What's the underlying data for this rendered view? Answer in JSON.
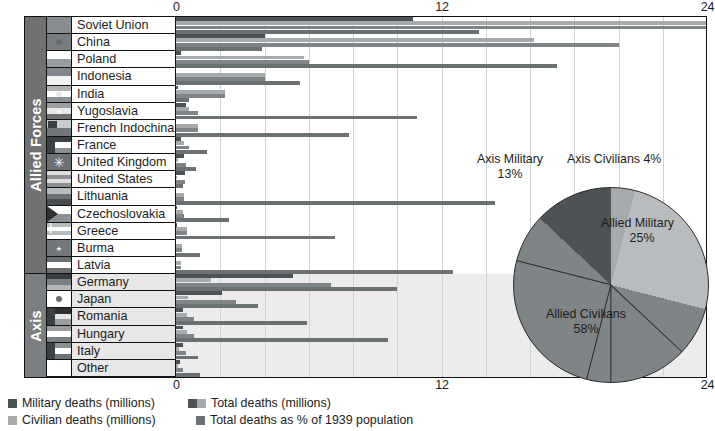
{
  "axis": {
    "ticks": [
      "0",
      "12",
      "24"
    ],
    "tick_values": [
      0,
      12,
      24
    ],
    "max": 24
  },
  "groups": {
    "allied_label": "Allied Forces",
    "axis_label": "Axis"
  },
  "legend": {
    "military": "Military deaths (millions)",
    "civilian": "Civilian deaths (millions)",
    "total": "Total deaths (millions)",
    "percent": "Total deaths  as % of 1939 population"
  },
  "colors": {
    "military": "#4d5255",
    "civilian": "#a7aaac",
    "total": "#7f8486",
    "percent": "#6b7073",
    "band": "#6f7173",
    "axis_row_bg": "#e7e7e7"
  },
  "pie": {
    "title": "",
    "slices": [
      {
        "label": "Allied Civilians",
        "pct_label": "58%",
        "value": 58,
        "color": "#7f8486"
      },
      {
        "label": "Axis Military",
        "pct_label": "13%",
        "value": 13,
        "color": "#4d5255"
      },
      {
        "label": "Axis Civilians 4%",
        "pct_label": "",
        "value": 4,
        "color": "#a7aaac"
      },
      {
        "label": "Allied Military",
        "pct_label": "25%",
        "value": 25,
        "color": "#b9bcbe"
      }
    ]
  },
  "chart_data": {
    "type": "bar",
    "xlabel": "",
    "ylabel": "",
    "xlim": [
      0,
      24
    ],
    "grid": true,
    "legend_position": "bottom-left",
    "orientation": "horizontal",
    "series": [
      {
        "name": "Military deaths (millions)",
        "color": "#4d5255"
      },
      {
        "name": "Civilian deaths (millions)",
        "color": "#a7aaac"
      },
      {
        "name": "Total deaths (millions)",
        "color": "#7f8486"
      },
      {
        "name": "Total deaths  as % of 1939 population",
        "color": "#6b7073"
      }
    ],
    "categories": [
      "Soviet Union",
      "China",
      "Poland",
      "Indonesia",
      "India",
      "Yugoslavia",
      "French Indochina",
      "France",
      "United Kingdom",
      "United States",
      "Lithuania",
      "Czechoslovakia",
      "Greece",
      "Burma",
      "Latvia",
      "Germany",
      "Japan",
      "Romania",
      "Hungary",
      "Italy",
      "Other"
    ],
    "groups": {
      "Allied Forces": [
        "Soviet Union",
        "China",
        "Poland",
        "Indonesia",
        "India",
        "Yugoslavia",
        "French Indochina",
        "France",
        "United Kingdom",
        "United States",
        "Lithuania",
        "Czechoslovakia",
        "Greece",
        "Burma",
        "Latvia"
      ],
      "Axis": [
        "Germany",
        "Japan",
        "Romania",
        "Hungary",
        "Italy",
        "Other"
      ]
    },
    "rows": [
      {
        "country": "Soviet Union",
        "military": 10.7,
        "civilian": 24.0,
        "total": 24.0,
        "pct": 13.7
      },
      {
        "country": "China",
        "military": 4.0,
        "civilian": 16.2,
        "total": 20.0,
        "pct": 3.9
      },
      {
        "country": "Poland",
        "military": 0.24,
        "civilian": 5.8,
        "total": 6.0,
        "pct": 17.2
      },
      {
        "country": "Indonesia",
        "military": 0.0,
        "civilian": 4.0,
        "total": 4.0,
        "pct": 5.6
      },
      {
        "country": "India",
        "military": 0.09,
        "civilian": 2.2,
        "total": 2.2,
        "pct": 0.6
      },
      {
        "country": "Yugoslavia",
        "military": 0.45,
        "civilian": 0.6,
        "total": 1.0,
        "pct": 10.9
      },
      {
        "country": "French Indochina",
        "military": 0.0,
        "civilian": 1.0,
        "total": 1.0,
        "pct": 7.8
      },
      {
        "country": "France",
        "military": 0.21,
        "civilian": 0.35,
        "total": 0.6,
        "pct": 1.4
      },
      {
        "country": "United Kingdom",
        "military": 0.38,
        "civilian": 0.07,
        "total": 0.45,
        "pct": 0.9
      },
      {
        "country": "United States",
        "military": 0.42,
        "civilian": 0.01,
        "total": 0.42,
        "pct": 0.3
      },
      {
        "country": "Lithuania",
        "military": 0.0,
        "civilian": 0.35,
        "total": 0.35,
        "pct": 14.4
      },
      {
        "country": "Czechoslovakia",
        "military": 0.03,
        "civilian": 0.32,
        "total": 0.35,
        "pct": 2.4
      },
      {
        "country": "Greece",
        "military": 0.03,
        "civilian": 0.5,
        "total": 0.5,
        "pct": 7.2
      },
      {
        "country": "Burma",
        "military": 0.0,
        "civilian": 0.25,
        "total": 0.25,
        "pct": 1.1
      },
      {
        "country": "Latvia",
        "military": 0.0,
        "civilian": 0.22,
        "total": 0.22,
        "pct": 12.5
      },
      {
        "country": "Germany",
        "military": 5.3,
        "civilian": 1.6,
        "total": 7.0,
        "pct": 10.0
      },
      {
        "country": "Japan",
        "military": 2.1,
        "civilian": 0.55,
        "total": 2.7,
        "pct": 3.7
      },
      {
        "country": "Romania",
        "military": 0.3,
        "civilian": 0.5,
        "total": 0.8,
        "pct": 5.9
      },
      {
        "country": "Hungary",
        "military": 0.3,
        "civilian": 0.5,
        "total": 0.8,
        "pct": 9.6
      },
      {
        "country": "Italy",
        "military": 0.3,
        "civilian": 0.15,
        "total": 0.46,
        "pct": 1.0
      },
      {
        "country": "Other",
        "military": 0.2,
        "civilian": 0.1,
        "total": 0.3,
        "pct": 1.1
      }
    ]
  },
  "flags": [
    {
      "country": "Soviet Union",
      "bands": [
        "#8a8d8f"
      ],
      "mark": "none"
    },
    {
      "country": "China",
      "bands": [
        "#7a7d7f"
      ],
      "mark": "dot"
    },
    {
      "country": "Poland",
      "bands": [
        "#ffffff",
        "#9a9d9f"
      ],
      "mark": "none"
    },
    {
      "country": "Indonesia",
      "bands": [
        "#83868a",
        "#f2f2f2"
      ],
      "mark": "none"
    },
    {
      "country": "India",
      "bands": [
        "#b0b3b5",
        "#ffffff",
        "#8d9092"
      ],
      "mark": "dot"
    },
    {
      "country": "Yugoslavia",
      "bands": [
        "#9b9ea0",
        "#e8e8e8",
        "#6f7274"
      ],
      "mark": "star"
    },
    {
      "country": "French Indochina",
      "bands": [
        "#c9ccce",
        "#72767a"
      ],
      "mark": "block"
    },
    {
      "country": "France",
      "bands": [
        "#3f4245",
        "#ffffff",
        "#8d9092"
      ],
      "mark": "vert"
    },
    {
      "country": "United Kingdom",
      "bands": [
        "#6d7074"
      ],
      "mark": "union"
    },
    {
      "country": "United States",
      "bands": [
        "#dcdcdc",
        "#8d9092",
        "#dcdcdc",
        "#8d9092"
      ],
      "mark": "none"
    },
    {
      "country": "Lithuania",
      "bands": [
        "#b9bcbe",
        "#6f7274",
        "#4a4d50"
      ],
      "mark": "none"
    },
    {
      "country": "Czechoslovakia",
      "bands": [
        "#ffffff",
        "#8d9092"
      ],
      "mark": "tri"
    },
    {
      "country": "Greece",
      "bands": [
        "#b8bbbd",
        "#ffffff",
        "#b8bbbd",
        "#ffffff"
      ],
      "mark": "cross"
    },
    {
      "country": "Burma",
      "bands": [
        "#72767a"
      ],
      "mark": "star"
    },
    {
      "country": "Latvia",
      "bands": [
        "#6b6e71",
        "#ffffff",
        "#6b6e71"
      ],
      "mark": "none"
    },
    {
      "country": "Germany",
      "bands": [
        "#3b3e41",
        "#7d8082",
        "#b4b7b9"
      ],
      "mark": "none"
    },
    {
      "country": "Japan",
      "bands": [
        "#ffffff"
      ],
      "mark": "dot"
    },
    {
      "country": "Romania",
      "bands": [
        "#2f3235",
        "#e6e6e6",
        "#9a9d9f"
      ],
      "mark": "vert"
    },
    {
      "country": "Hungary",
      "bands": [
        "#9a9d9f",
        "#ffffff",
        "#7d8082"
      ],
      "mark": "none"
    },
    {
      "country": "Italy",
      "bands": [
        "#8d9092",
        "#ffffff",
        "#6f7274"
      ],
      "mark": "vert"
    },
    {
      "country": "Other",
      "bands": [
        "#ffffff"
      ],
      "mark": "none"
    }
  ]
}
